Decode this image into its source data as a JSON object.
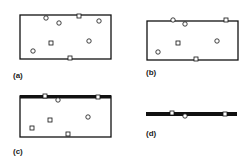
{
  "figure": {
    "panels": [
      {
        "id": "a",
        "label": "(a)",
        "label_pos": [
          13,
          71
        ],
        "shape": "rect",
        "rect": [
          20,
          15,
          91,
          44
        ],
        "thick_top": false,
        "markers": [
          {
            "type": "circle",
            "x": 46,
            "y": 18
          },
          {
            "type": "circle",
            "x": 59,
            "y": 23
          },
          {
            "type": "square",
            "x": 79,
            "y": 16
          },
          {
            "type": "circle",
            "x": 99,
            "y": 21
          },
          {
            "type": "square",
            "x": 51,
            "y": 43
          },
          {
            "type": "circle",
            "x": 89,
            "y": 41
          },
          {
            "type": "circle",
            "x": 33,
            "y": 51
          },
          {
            "type": "square",
            "x": 70,
            "y": 58
          }
        ]
      },
      {
        "id": "b",
        "label": "(b)",
        "label_pos": [
          146,
          68
        ],
        "shape": "rect",
        "rect": [
          147,
          21,
          91,
          39
        ],
        "thick_top": false,
        "markers": [
          {
            "type": "circle",
            "x": 173,
            "y": 20
          },
          {
            "type": "circle",
            "x": 185,
            "y": 24
          },
          {
            "type": "square",
            "x": 226,
            "y": 20
          },
          {
            "type": "square",
            "x": 178,
            "y": 43
          },
          {
            "type": "circle",
            "x": 217,
            "y": 41
          },
          {
            "type": "circle",
            "x": 158,
            "y": 52
          },
          {
            "type": "square",
            "x": 196,
            "y": 59
          }
        ]
      },
      {
        "id": "c",
        "label": "(c)",
        "label_pos": [
          13,
          147
        ],
        "shape": "rect",
        "rect": [
          20,
          96,
          91,
          41
        ],
        "thick_top": true,
        "markers": [
          {
            "type": "square",
            "x": 45,
            "y": 96
          },
          {
            "type": "circle",
            "x": 58,
            "y": 100
          },
          {
            "type": "square",
            "x": 98,
            "y": 97
          },
          {
            "type": "square",
            "x": 50,
            "y": 120
          },
          {
            "type": "circle",
            "x": 88,
            "y": 117
          },
          {
            "type": "square",
            "x": 32,
            "y": 128
          },
          {
            "type": "square",
            "x": 68,
            "y": 134
          }
        ]
      },
      {
        "id": "d",
        "label": "(d)",
        "label_pos": [
          146,
          129
        ],
        "shape": "bar",
        "rect": [
          146,
          112,
          91,
          4
        ],
        "thick_top": false,
        "markers": [
          {
            "type": "square",
            "x": 172,
            "y": 113
          },
          {
            "type": "circle",
            "x": 185,
            "y": 116
          },
          {
            "type": "square",
            "x": 225,
            "y": 114
          }
        ]
      }
    ],
    "colors": {
      "stroke": "#111111",
      "fill": "#ffffff"
    }
  }
}
